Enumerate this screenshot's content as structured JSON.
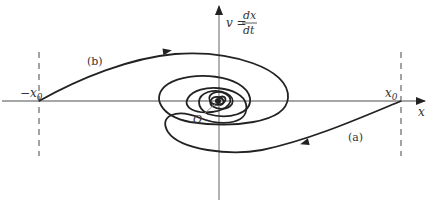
{
  "diagram": {
    "type": "phase-plane spiral",
    "axes": {
      "x_label": "x",
      "y_label_lhs": "v =",
      "y_label_num": "dx",
      "y_label_den": "dt",
      "origin_label": "O"
    },
    "markers": {
      "left": "−x",
      "left_sub": "0",
      "right": "x",
      "right_sub": "0"
    },
    "curves": [
      {
        "label": "(b)",
        "start": "−x0",
        "direction": "clockwise inward"
      },
      {
        "label": "(a)",
        "start": "x0",
        "direction": "clockwise inward"
      }
    ],
    "colors": {
      "axis": "#888888",
      "curve": "#222222",
      "dashed": "#666666",
      "text": "#333333"
    }
  }
}
